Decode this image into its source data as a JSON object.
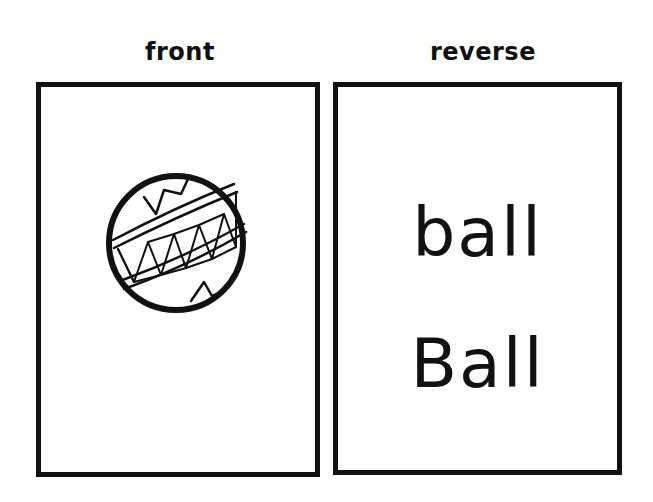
{
  "labels": {
    "front": "front",
    "reverse": "reverse"
  },
  "front_card": {
    "image": "ball-drawing"
  },
  "reverse_card": {
    "lowercase_word": "ball",
    "capitalized_word": "Ball"
  }
}
